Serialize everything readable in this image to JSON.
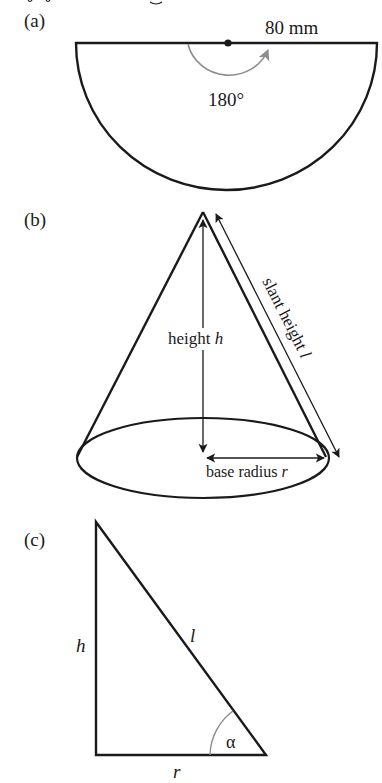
{
  "header_fragment": "(·) ... g ...",
  "panels": {
    "a": {
      "label": "(a)",
      "radius_label": "80 mm",
      "angle_label": "180°",
      "shape": "semicircle sector"
    },
    "b": {
      "label": "(b)",
      "height_label_prefix": "height ",
      "height_symbol": "h",
      "slant_label_prefix": "slant height ",
      "slant_symbol": "l",
      "radius_label_prefix": "base radius ",
      "radius_symbol": "r",
      "shape": "cone"
    },
    "c": {
      "label": "(c)",
      "side_h": "h",
      "side_l": "l",
      "side_r": "r",
      "angle": "α",
      "shape": "right triangle"
    }
  },
  "colors": {
    "stroke": "#1a1a1a",
    "arc_gray": "#8c8c8c",
    "background": "#ffffff"
  }
}
